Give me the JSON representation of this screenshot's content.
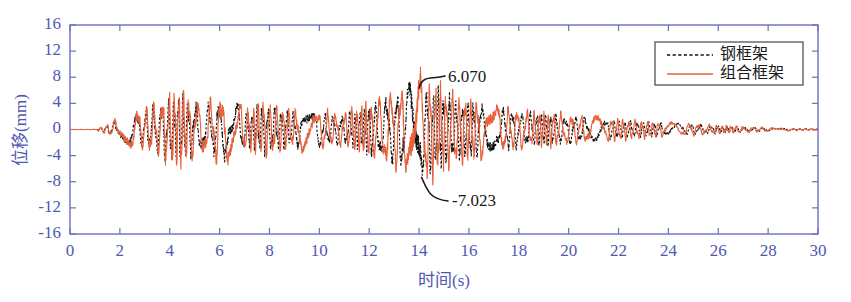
{
  "chart_data": {
    "type": "line",
    "title": "",
    "xlabel": "时间(s)",
    "ylabel": "位移(mm)",
    "xlim": [
      0,
      30
    ],
    "ylim": [
      -16,
      16
    ],
    "xticks": [
      "0",
      "2",
      "4",
      "6",
      "8",
      "10",
      "12",
      "14",
      "16",
      "18",
      "20",
      "22",
      "24",
      "26",
      "28",
      "30"
    ],
    "yticks": [
      "16",
      "12",
      "8",
      "4",
      "0",
      "-4",
      "-8",
      "-12",
      "-16"
    ],
    "grid": false,
    "legend_position": "top-right",
    "series": [
      {
        "name": "钢框架",
        "style": "dashed",
        "color": "#111111",
        "envelope_t": [
          0,
          1.0,
          1.5,
          2.0,
          2.6,
          3.2,
          3.8,
          4.3,
          4.8,
          5.4,
          6.0,
          6.6,
          7.2,
          7.8,
          8.4,
          9.0,
          9.6,
          10.2,
          10.8,
          11.4,
          12.0,
          12.6,
          13.2,
          13.7,
          14.1,
          14.5,
          15.0,
          15.6,
          16.2,
          16.8,
          17.4,
          18.0,
          18.8,
          19.6,
          20.4,
          21.2,
          22.0,
          23.0,
          24.0,
          25.0,
          26.0,
          27.0,
          28.0,
          29.0,
          30.0
        ],
        "envelope_a": [
          0.05,
          0.1,
          0.5,
          1.3,
          2.0,
          2.6,
          3.4,
          4.3,
          3.3,
          2.6,
          3.5,
          3.0,
          2.2,
          2.9,
          2.5,
          1.9,
          2.4,
          2.0,
          1.6,
          2.2,
          2.9,
          3.6,
          4.4,
          5.4,
          5.6,
          5.0,
          4.2,
          3.6,
          3.2,
          2.9,
          2.4,
          2.1,
          1.9,
          1.7,
          1.5,
          1.3,
          1.1,
          0.9,
          0.75,
          0.6,
          0.45,
          0.3,
          0.2,
          0.12,
          0.07
        ]
      },
      {
        "name": "组合框架",
        "style": "solid",
        "color": "#e8603c",
        "envelope_t": [
          0,
          1.0,
          1.5,
          2.0,
          2.6,
          3.2,
          3.8,
          4.3,
          4.8,
          5.4,
          6.0,
          6.6,
          7.2,
          7.8,
          8.4,
          9.0,
          9.6,
          10.2,
          10.8,
          11.4,
          12.0,
          12.6,
          13.2,
          13.7,
          14.1,
          14.5,
          15.0,
          15.6,
          16.2,
          16.8,
          17.4,
          18.0,
          18.8,
          19.6,
          20.4,
          21.2,
          22.0,
          23.0,
          24.0,
          25.0,
          26.0,
          27.0,
          28.0,
          29.0,
          30.0
        ],
        "envelope_a": [
          0.05,
          0.12,
          0.6,
          1.5,
          2.3,
          3.0,
          3.9,
          4.9,
          3.8,
          3.0,
          4.0,
          3.4,
          2.5,
          3.3,
          2.8,
          2.2,
          2.7,
          2.3,
          1.8,
          2.5,
          3.3,
          4.1,
          5.0,
          6.07,
          6.2,
          5.6,
          4.7,
          4.0,
          3.6,
          3.2,
          2.7,
          2.3,
          2.1,
          1.9,
          1.7,
          1.5,
          1.3,
          1.05,
          0.85,
          0.7,
          0.52,
          0.36,
          0.24,
          0.14,
          0.08
        ]
      }
    ],
    "annotations": [
      {
        "label": "6.070",
        "t": 14.0,
        "value": 6.07,
        "text_x": 448,
        "text_y": 78
      },
      {
        "label": "-7.023",
        "t": 14.1,
        "value": -7.023,
        "text_x": 452,
        "text_y": 202
      }
    ],
    "colors": {
      "axis": "#6a6fc0",
      "tick_label": "#5158b0",
      "series_steel": "#111111",
      "series_composite": "#e8603c",
      "legend_border": "#444444",
      "background": "#ffffff"
    }
  },
  "legend": {
    "items": [
      {
        "label": "钢框架"
      },
      {
        "label": "组合框架"
      }
    ]
  },
  "axes": {
    "x_title": "时间(s)",
    "y_title": "位移(mm)"
  }
}
